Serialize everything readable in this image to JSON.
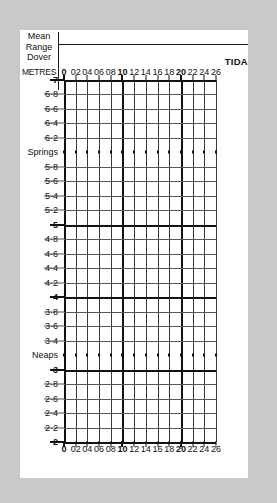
{
  "page": {
    "background_color": "#c9c9c9",
    "card_color": "#ffffff",
    "ink_color": "#111111"
  },
  "header": {
    "corner_label_lines": [
      "Mean",
      "Range",
      "Dover"
    ],
    "units_label": "METRES",
    "title_clipped": "TIDA"
  },
  "chart_data": {
    "type": "table",
    "title": "TIDA",
    "ylabel": "METRES",
    "xlabel": "",
    "grid": true,
    "legend": "none",
    "ylim": [
      2,
      7
    ],
    "xlim": [
      0,
      26
    ],
    "x_ticks": [
      "0",
      "02",
      "04",
      "06",
      "08",
      "10",
      "12",
      "14",
      "16",
      "18",
      "20",
      "22",
      "24",
      "26"
    ],
    "x_ticks_bold": [
      "0",
      "10",
      "20"
    ],
    "y_rows": [
      {
        "label": "7",
        "value": 7.0,
        "style": "major"
      },
      {
        "label": "6·8",
        "value": 6.8,
        "style": "minor"
      },
      {
        "label": "6·6",
        "value": 6.6,
        "style": "minor"
      },
      {
        "label": "6·4",
        "value": 6.4,
        "style": "minor"
      },
      {
        "label": "6·2",
        "value": 6.2,
        "style": "minor"
      },
      {
        "label": "Springs",
        "value": 6.0,
        "style": "dotted"
      },
      {
        "label": "5·8",
        "value": 5.8,
        "style": "minor"
      },
      {
        "label": "5·6",
        "value": 5.6,
        "style": "minor"
      },
      {
        "label": "5·4",
        "value": 5.4,
        "style": "minor"
      },
      {
        "label": "5·2",
        "value": 5.2,
        "style": "minor"
      },
      {
        "label": "5",
        "value": 5.0,
        "style": "major"
      },
      {
        "label": "4·8",
        "value": 4.8,
        "style": "minor"
      },
      {
        "label": "4·6",
        "value": 4.6,
        "style": "minor"
      },
      {
        "label": "4·4",
        "value": 4.4,
        "style": "minor"
      },
      {
        "label": "4·2",
        "value": 4.2,
        "style": "minor"
      },
      {
        "label": "4",
        "value": 4.0,
        "style": "major"
      },
      {
        "label": "3·8",
        "value": 3.8,
        "style": "minor"
      },
      {
        "label": "3·6",
        "value": 3.6,
        "style": "minor"
      },
      {
        "label": "3·4",
        "value": 3.4,
        "style": "minor"
      },
      {
        "label": "Neaps",
        "value": 3.2,
        "style": "dotted"
      },
      {
        "label": "3",
        "value": 3.0,
        "style": "major"
      },
      {
        "label": "2·8",
        "value": 2.8,
        "style": "minor"
      },
      {
        "label": "2·6",
        "value": 2.6,
        "style": "minor"
      },
      {
        "label": "2·4",
        "value": 2.4,
        "style": "minor"
      },
      {
        "label": "2·2",
        "value": 2.2,
        "style": "minor"
      },
      {
        "label": "2",
        "value": 2.0,
        "style": "major"
      }
    ],
    "series": [],
    "values": []
  }
}
